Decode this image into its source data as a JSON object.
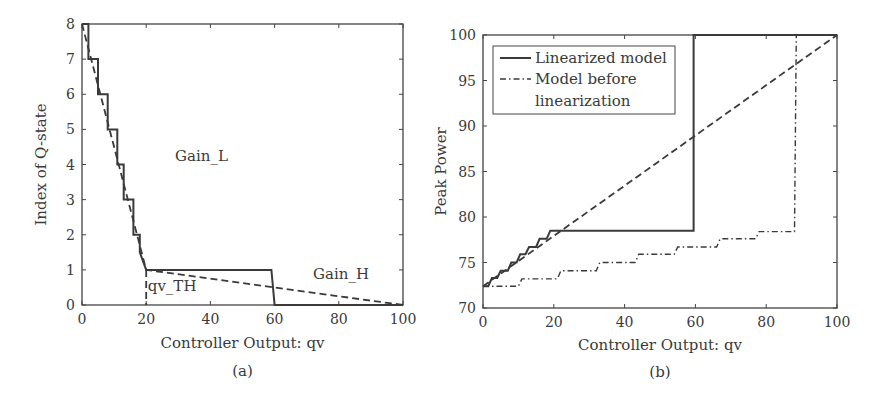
{
  "figure": {
    "panel_a_caption": "(a)",
    "panel_b_caption": "(b)"
  },
  "colors": {
    "line": "#3a3a3a",
    "axis": "#444444",
    "background": "#ffffff"
  },
  "chart_data": [
    {
      "type": "line",
      "panel": "a",
      "title": "",
      "xlabel": "Controller Output: qv",
      "ylabel": "Index of Q-state",
      "xlim": [
        0,
        100
      ],
      "ylim": [
        0,
        8
      ],
      "xticks": [
        0,
        20,
        40,
        60,
        80,
        100
      ],
      "yticks": [
        0,
        1,
        2,
        3,
        4,
        5,
        6,
        7,
        8
      ],
      "grid": false,
      "annotations": [
        {
          "text": "Gain_L",
          "x": 29,
          "y": 4.1
        },
        {
          "text": "Gain_H",
          "x": 72,
          "y": 0.75
        },
        {
          "text": "qv_TH",
          "x": 20.5,
          "y": 0.4
        }
      ],
      "series": [
        {
          "name": "Q-state index (step)",
          "style": "solid",
          "points": [
            [
              0,
              8
            ],
            [
              2,
              8
            ],
            [
              2,
              7
            ],
            [
              5,
              7
            ],
            [
              5,
              6
            ],
            [
              8,
              6
            ],
            [
              8,
              5
            ],
            [
              11,
              5
            ],
            [
              11,
              4
            ],
            [
              13,
              4
            ],
            [
              13,
              3
            ],
            [
              16,
              3
            ],
            [
              16,
              2
            ],
            [
              18,
              2
            ],
            [
              18,
              1.5
            ],
            [
              20,
              1
            ],
            [
              59,
              1
            ],
            [
              60,
              0
            ],
            [
              100,
              0
            ]
          ]
        },
        {
          "name": "Linear gain approximation",
          "style": "dashed",
          "points": [
            [
              0,
              8
            ],
            [
              20,
              1
            ],
            [
              100,
              0
            ]
          ]
        },
        {
          "name": "qv_TH marker",
          "style": "dashed",
          "points": [
            [
              20,
              1
            ],
            [
              20,
              0
            ]
          ]
        }
      ]
    },
    {
      "type": "line",
      "panel": "b",
      "title": "",
      "xlabel": "Controller Output: qv",
      "ylabel": "Peak Power",
      "xlim": [
        0,
        100
      ],
      "ylim": [
        70,
        100
      ],
      "xticks": [
        0,
        20,
        40,
        60,
        80,
        100
      ],
      "yticks": [
        70,
        75,
        80,
        85,
        90,
        95,
        100
      ],
      "grid": false,
      "legend": {
        "position": "upper left",
        "entries": [
          {
            "label": "Linearized model",
            "style": "solid"
          },
          {
            "label": "Model before",
            "label_line2": "linearization",
            "style": "dashdot"
          }
        ]
      },
      "series": [
        {
          "name": "Linearized model",
          "style": "solid",
          "points": [
            [
              0,
              72.4
            ],
            [
              1.5,
              72.4
            ],
            [
              2.5,
              73.3
            ],
            [
              4,
              73.3
            ],
            [
              5,
              74.1
            ],
            [
              7,
              74.1
            ],
            [
              8,
              75
            ],
            [
              9.5,
              75
            ],
            [
              10.5,
              75.9
            ],
            [
              12,
              75.9
            ],
            [
              13,
              76.7
            ],
            [
              15,
              76.7
            ],
            [
              16,
              77.6
            ],
            [
              18,
              77.6
            ],
            [
              19,
              78.5
            ],
            [
              59.5,
              78.5
            ],
            [
              59.5,
              100
            ],
            [
              100,
              100
            ]
          ]
        },
        {
          "name": "Model before linearization",
          "style": "dashdot",
          "points": [
            [
              0,
              72.4
            ],
            [
              10,
              72.4
            ],
            [
              11,
              73.2
            ],
            [
              21,
              73.2
            ],
            [
              22,
              74.1
            ],
            [
              32,
              74.1
            ],
            [
              33,
              75
            ],
            [
              43,
              75
            ],
            [
              44,
              75.9
            ],
            [
              54,
              75.9
            ],
            [
              55,
              76.7
            ],
            [
              66,
              76.7
            ],
            [
              67,
              77.6
            ],
            [
              77,
              77.6
            ],
            [
              78,
              78.4
            ],
            [
              88,
              78.4
            ],
            [
              88.5,
              100
            ],
            [
              100,
              100
            ]
          ]
        },
        {
          "name": "Linear reference",
          "style": "dashed",
          "points": [
            [
              0,
              72.4
            ],
            [
              100,
              100
            ]
          ]
        }
      ]
    }
  ]
}
